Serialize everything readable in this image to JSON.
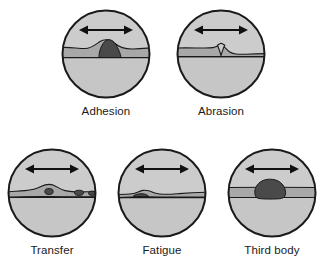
{
  "figure": {
    "name": "wear-mechanisms-diagram",
    "background_color": "#ffffff"
  },
  "colors": {
    "outline": "#1a1a1a",
    "upper_body": "#cccccc",
    "interface_band": "#a8a8a8",
    "lower_body": "#c6c6c6",
    "debris_dark": "#4a4a4a",
    "arrow": "#111111",
    "caption_text": "#1a1a1a"
  },
  "panels": [
    {
      "id": "adhesion",
      "label": "Adhesion",
      "row": 1,
      "column": 1,
      "arrow": "double-headed-horizontal-arrow",
      "feature": "large dark adhered lump bridging the interface band"
    },
    {
      "id": "abrasion",
      "label": "Abrasion",
      "row": 1,
      "column": 2,
      "arrow": "double-headed-horizontal-arrow",
      "feature": "sharp downward groove cutting into the lower surface"
    },
    {
      "id": "transfer",
      "label": "Transfer",
      "row": 2,
      "column": 1,
      "arrow": "double-headed-horizontal-arrow",
      "feature": "material bump with small detached dark particles transferred across the band"
    },
    {
      "id": "fatigue",
      "label": "Fatigue",
      "row": 2,
      "column": 2,
      "arrow": "double-headed-horizontal-arrow",
      "feature": "flattened subsurface crack with small dark flake"
    },
    {
      "id": "third-body",
      "label": "Third body",
      "row": 2,
      "column": 3,
      "arrow": "double-headed-horizontal-arrow",
      "feature": "large dark third-body particle trapped within the interface band"
    }
  ]
}
